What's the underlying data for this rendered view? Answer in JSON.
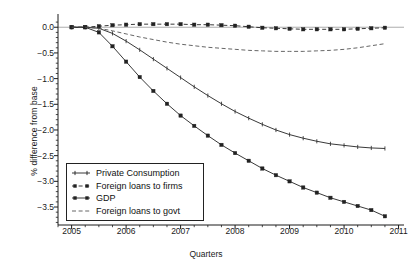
{
  "chart_data": {
    "type": "line",
    "title": "",
    "xlabel": "Quarters",
    "ylabel": "% difference from base",
    "xlim": [
      2004.75,
      2011.1
    ],
    "ylim": [
      -3.85,
      0.18
    ],
    "yticks": [
      0.0,
      -0.5,
      -1.0,
      -1.5,
      -2.0,
      -2.5,
      -3.0,
      -3.5
    ],
    "ytick_labels": [
      "0.0",
      "−0.5",
      "−1.0",
      "−1.5",
      "−2.0",
      "−2.5",
      "−3.0",
      "−3.5"
    ],
    "xticks": [
      2005,
      2006,
      2007,
      2008,
      2009,
      2010,
      2011
    ],
    "xtick_labels": [
      "2005",
      "2006",
      "2007",
      "2008",
      "2009",
      "2010",
      "2011"
    ],
    "y_minor_step": 0.1,
    "x_minor_step": 0.25,
    "grid": false,
    "zero_line": true,
    "legend_position": "lower-left",
    "x": [
      2005.0,
      2005.25,
      2005.5,
      2005.75,
      2006.0,
      2006.25,
      2006.5,
      2006.75,
      2007.0,
      2007.25,
      2007.5,
      2007.75,
      2008.0,
      2008.25,
      2008.5,
      2008.75,
      2009.0,
      2009.25,
      2009.5,
      2009.75,
      2010.0,
      2010.25,
      2010.5,
      2010.75
    ],
    "series": [
      {
        "name": "Private Consumption",
        "marker": "tick",
        "linestyle": "solid",
        "color": "#222222",
        "values": [
          0.0,
          0.0,
          -0.02,
          -0.12,
          -0.27,
          -0.44,
          -0.62,
          -0.8,
          -0.98,
          -1.16,
          -1.33,
          -1.49,
          -1.64,
          -1.77,
          -1.89,
          -2.0,
          -2.09,
          -2.16,
          -2.22,
          -2.27,
          -2.3,
          -2.33,
          -2.35,
          -2.36
        ]
      },
      {
        "name": "Foreign loans to firms",
        "marker": "square",
        "linestyle": "dashed",
        "color": "#222222",
        "values": [
          0.0,
          0.0,
          0.02,
          0.04,
          0.05,
          0.06,
          0.06,
          0.06,
          0.06,
          0.05,
          0.05,
          0.04,
          0.03,
          0.01,
          -0.01,
          -0.02,
          -0.03,
          -0.04,
          -0.04,
          -0.04,
          -0.04,
          -0.03,
          -0.02,
          -0.01
        ]
      },
      {
        "name": "GDP",
        "marker": "square",
        "linestyle": "solid",
        "color": "#222222",
        "values": [
          0.0,
          0.0,
          -0.1,
          -0.37,
          -0.67,
          -0.97,
          -1.24,
          -1.49,
          -1.72,
          -1.92,
          -2.11,
          -2.29,
          -2.45,
          -2.6,
          -2.75,
          -2.88,
          -3.0,
          -3.12,
          -3.22,
          -3.32,
          -3.4,
          -3.48,
          -3.56,
          -3.68
        ]
      },
      {
        "name": "Foreign loans to govt",
        "marker": "none",
        "linestyle": "dashed",
        "color": "#555555",
        "values": [
          0.0,
          0.0,
          -0.02,
          -0.07,
          -0.13,
          -0.19,
          -0.24,
          -0.29,
          -0.33,
          -0.36,
          -0.39,
          -0.41,
          -0.43,
          -0.45,
          -0.46,
          -0.47,
          -0.47,
          -0.47,
          -0.46,
          -0.45,
          -0.43,
          -0.4,
          -0.36,
          -0.32
        ]
      }
    ]
  },
  "legend": {
    "entries": [
      {
        "label": "Private Consumption"
      },
      {
        "label": "Foreign loans to firms"
      },
      {
        "label": "GDP"
      },
      {
        "label": "Foreign loans to govt"
      }
    ]
  }
}
